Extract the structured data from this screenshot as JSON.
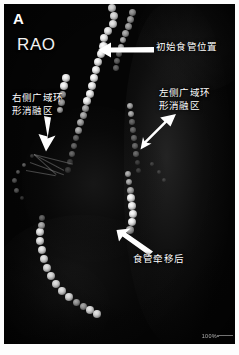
{
  "figure": {
    "panel_label": "A",
    "projection": "RAO",
    "modality": "fluoroscopy",
    "scale_text": "100%"
  },
  "annotations": [
    {
      "id": "initial-esophagus-position",
      "text": "初始食管位置",
      "arrow": "arrow-left"
    },
    {
      "id": "left-wide-area-circumferential-ablation-zone",
      "line1": "左侧广域环",
      "line2": "形消融区",
      "arrow": "arrow-down-left"
    },
    {
      "id": "right-wide-area-circumferential-ablation-zone",
      "line1": "右侧广域环",
      "line2": "形消融区",
      "arrow": "arrow-down"
    },
    {
      "id": "esophagus-after-deviation",
      "text": "食管牵移后",
      "arrow": "arrow-up-left"
    }
  ],
  "colors": {
    "annotation_text": "#ffffff",
    "arrow": "#ffffff",
    "background": "#050505",
    "frame": "#fdfdfd"
  }
}
